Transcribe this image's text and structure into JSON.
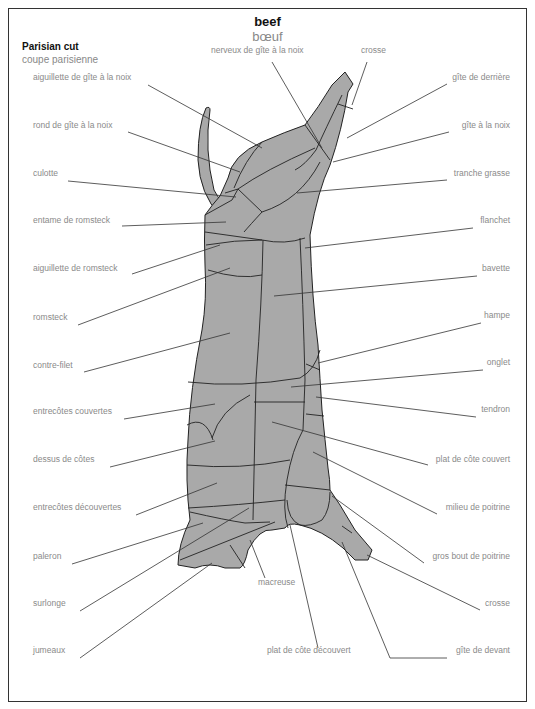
{
  "header": {
    "title_en": "beef",
    "title_fr": "bœuf",
    "subtitle_en": "Parisian cut",
    "subtitle_fr": "coupe parisienne"
  },
  "colors": {
    "fill": "#a9a9a9",
    "outline": "#222222",
    "leader": "#333333",
    "label": "#8a8a8a"
  },
  "labels_left": [
    {
      "text": "aiguillette de gîte à la noix",
      "x": 33,
      "y": 79
    },
    {
      "text": "rond de gîte à la noix",
      "x": 33,
      "y": 127
    },
    {
      "text": "culotte",
      "x": 33,
      "y": 175
    },
    {
      "text": "entame de romsteck",
      "x": 33,
      "y": 222
    },
    {
      "text": "aiguillette de romsteck",
      "x": 33,
      "y": 270
    },
    {
      "text": "romsteck",
      "x": 33,
      "y": 319
    },
    {
      "text": "contre-filet",
      "x": 33,
      "y": 367
    },
    {
      "text": "entrecôtes couvertes",
      "x": 33,
      "y": 413
    },
    {
      "text": "dessus de côtes",
      "x": 33,
      "y": 461
    },
    {
      "text": "entrecôtes découvertes",
      "x": 33,
      "y": 509
    },
    {
      "text": "paleron",
      "x": 33,
      "y": 558
    },
    {
      "text": "surlonge",
      "x": 33,
      "y": 605
    },
    {
      "text": "jumeaux",
      "x": 33,
      "y": 652
    }
  ],
  "labels_top": [
    {
      "text": "nerveux de gîte à la noix",
      "x": 211,
      "y": 52
    },
    {
      "text": "crosse",
      "x": 361,
      "y": 52
    }
  ],
  "labels_right": [
    {
      "text": "gîte de derrière",
      "x": 510,
      "y": 79
    },
    {
      "text": "gîte à la noix",
      "x": 510,
      "y": 127
    },
    {
      "text": "tranche grasse",
      "x": 510,
      "y": 175
    },
    {
      "text": "flanchet",
      "x": 510,
      "y": 222
    },
    {
      "text": "bavette",
      "x": 510,
      "y": 270
    },
    {
      "text": "hampe",
      "x": 510,
      "y": 317
    },
    {
      "text": "onglet",
      "x": 510,
      "y": 364
    },
    {
      "text": "tendron",
      "x": 510,
      "y": 411
    },
    {
      "text": "plat de côte couvert",
      "x": 510,
      "y": 461
    },
    {
      "text": "milieu de poitrine",
      "x": 510,
      "y": 509
    },
    {
      "text": "gros bout de poitrine",
      "x": 510,
      "y": 558
    },
    {
      "text": "crosse",
      "x": 510,
      "y": 605
    },
    {
      "text": "gîte de devant",
      "x": 510,
      "y": 652
    }
  ],
  "labels_bottom": [
    {
      "text": "macreuse",
      "x": 258,
      "y": 584
    },
    {
      "text": "plat de côte découvert",
      "x": 267,
      "y": 652
    }
  ]
}
